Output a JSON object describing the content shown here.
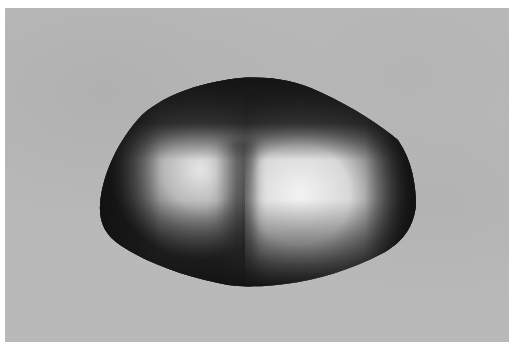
{
  "figure": {
    "colors": {
      "background": "#b9b9b9",
      "border": "#ffffff",
      "shadow": "#1a1a1a",
      "highlight": "#f2f2f2"
    }
  }
}
